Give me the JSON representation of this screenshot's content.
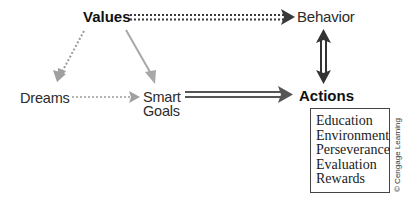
{
  "diagram": {
    "nodes": {
      "values": "Values",
      "behavior": "Behavior",
      "actions": "Actions",
      "dreams": "Dreams",
      "smart_goals": [
        "Smart",
        "Goals"
      ]
    },
    "action_factors": [
      "Education",
      "Environment",
      "Perseverance",
      "Evaluation",
      "Rewards"
    ],
    "edges": [
      {
        "from": "Values",
        "to": "Behavior",
        "style": "double-dotted",
        "direction": "forward"
      },
      {
        "from": "Values",
        "to": "Dreams",
        "style": "dotted",
        "direction": "forward"
      },
      {
        "from": "Values",
        "to": "Smart Goals",
        "style": "solid-gray",
        "direction": "forward"
      },
      {
        "from": "Dreams",
        "to": "Smart Goals",
        "style": "dotted",
        "direction": "forward"
      },
      {
        "from": "Smart Goals",
        "to": "Actions",
        "style": "double-solid",
        "direction": "forward"
      },
      {
        "from": "Behavior",
        "to": "Actions",
        "style": "double-solid",
        "direction": "bidirectional"
      }
    ],
    "copyright": "© Cengage Learning",
    "colors": {
      "arrow_dark": "#3a3a3a",
      "arrow_gray": "#a8a8a8",
      "text": "#2b2b2b"
    }
  }
}
